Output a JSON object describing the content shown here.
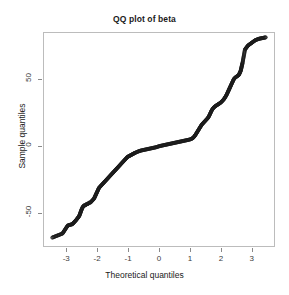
{
  "chart_data": {
    "type": "scatter",
    "title": "QQ plot of beta",
    "xlabel": "Theoretical quantiles",
    "ylabel": "Sample quantiles",
    "grid": false,
    "legend": null,
    "xlim": [
      -3.75,
      3.75
    ],
    "ylim": [
      -75,
      85
    ],
    "xticks": [
      -3,
      -2,
      -1,
      0,
      1,
      2,
      3
    ],
    "xticklabels": [
      "-3",
      "-2",
      "-1",
      "0",
      "1",
      "2",
      "3"
    ],
    "yticks": [
      -50,
      0,
      50
    ],
    "yticklabels": [
      "-50",
      "0",
      "50"
    ],
    "marker": "open-circle",
    "marker_color": "#1a1a1a",
    "series_name": "beta quantiles",
    "x": [
      -3.45,
      -3.12,
      -2.95,
      -2.8,
      -2.68,
      -2.58,
      -2.5,
      -2.46,
      -2.42,
      -2.38,
      -2.34,
      -2.3,
      -2.26,
      -2.22,
      -2.18,
      -2.14,
      -2.1,
      -2.06,
      -2.02,
      -1.98,
      -1.94,
      -1.9,
      -1.86,
      -1.82,
      -1.78,
      -1.74,
      -1.7,
      -1.66,
      -1.62,
      -1.58,
      -1.54,
      -1.5,
      -1.46,
      -1.42,
      -1.38,
      -1.34,
      -1.3,
      -1.26,
      -1.22,
      -1.18,
      -1.14,
      -1.1,
      -1.06,
      -1.02,
      -0.98,
      -0.94,
      -0.9,
      -0.86,
      -0.82,
      -0.78,
      -0.74,
      -0.7,
      -0.66,
      -0.62,
      -0.58,
      -0.54,
      -0.5,
      -0.46,
      -0.42,
      -0.38,
      -0.34,
      -0.3,
      -0.26,
      -0.22,
      -0.18,
      -0.14,
      -0.1,
      -0.06,
      -0.02,
      0.02,
      0.06,
      0.1,
      0.14,
      0.18,
      0.22,
      0.26,
      0.3,
      0.34,
      0.38,
      0.42,
      0.46,
      0.5,
      0.54,
      0.58,
      0.62,
      0.66,
      0.7,
      0.74,
      0.78,
      0.82,
      0.86,
      0.9,
      0.94,
      0.98,
      1.02,
      1.06,
      1.1,
      1.14,
      1.18,
      1.22,
      1.26,
      1.3,
      1.34,
      1.38,
      1.42,
      1.46,
      1.5,
      1.54,
      1.58,
      1.62,
      1.66,
      1.7,
      1.74,
      1.78,
      1.82,
      1.86,
      1.9,
      1.94,
      1.98,
      2.02,
      2.06,
      2.1,
      2.14,
      2.18,
      2.22,
      2.26,
      2.3,
      2.34,
      2.38,
      2.42,
      2.46,
      2.52,
      2.58,
      2.64,
      2.7,
      2.78,
      2.88,
      3.0,
      3.12,
      3.24,
      3.45
    ],
    "y": [
      -68,
      -65,
      -59,
      -58,
      -55,
      -52,
      -47,
      -45,
      -44,
      -44,
      -43,
      -43,
      -42,
      -42,
      -41,
      -40,
      -39,
      -37,
      -35,
      -33,
      -31,
      -30,
      -29,
      -28,
      -27,
      -26,
      -25,
      -24,
      -23,
      -22,
      -21,
      -20,
      -19,
      -18,
      -17,
      -16,
      -15,
      -14,
      -13,
      -12,
      -11,
      -10,
      -9,
      -8,
      -7.5,
      -7,
      -6.5,
      -6,
      -5.5,
      -5,
      -4.6,
      -4.2,
      -3.8,
      -3.5,
      -3.2,
      -3.0,
      -2.8,
      -2.6,
      -2.4,
      -2.2,
      -2.0,
      -1.8,
      -1.6,
      -1.4,
      -1.2,
      -1.0,
      -0.8,
      -0.5,
      -0.2,
      0.1,
      0.3,
      0.5,
      0.7,
      0.9,
      1.1,
      1.3,
      1.5,
      1.7,
      1.9,
      2.1,
      2.3,
      2.5,
      2.7,
      2.9,
      3.1,
      3.3,
      3.5,
      3.7,
      3.9,
      4.1,
      4.3,
      4.5,
      4.7,
      4.9,
      5.2,
      5.6,
      6.2,
      7.2,
      8.5,
      10.0,
      11.5,
      13.0,
      14.5,
      16.0,
      17.0,
      18.0,
      19.0,
      20.0,
      21.0,
      22.5,
      24.5,
      26.5,
      28.0,
      29.0,
      29.8,
      30.4,
      31.0,
      31.6,
      32.2,
      33.0,
      34.0,
      35.0,
      36.5,
      38.0,
      40.0,
      42.0,
      44.0,
      46.0,
      48.0,
      50.0,
      51.0,
      52.0,
      53.0,
      56.0,
      62.0,
      72.0,
      75.0,
      77.0,
      79.0,
      80.0,
      81.0
    ]
  }
}
